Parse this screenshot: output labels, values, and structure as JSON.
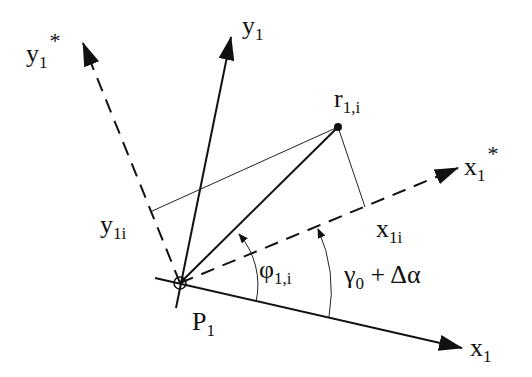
{
  "diagram": {
    "origin": {
      "label": "P",
      "sub": "1",
      "x": 180,
      "y": 283
    },
    "point": {
      "label": "r",
      "sub": "1,i",
      "x": 338,
      "y": 127
    },
    "axes": {
      "x1": {
        "label": "x",
        "sub": "1",
        "sup": "",
        "style": "solid"
      },
      "y1": {
        "label": "y",
        "sub": "1",
        "sup": "",
        "style": "solid"
      },
      "x1_star": {
        "label": "x",
        "sub": "1",
        "sup": "*",
        "style": "dashed"
      },
      "y1_star": {
        "label": "y",
        "sub": "1",
        "sup": "*",
        "style": "dashed"
      }
    },
    "projections": {
      "x1i": {
        "label": "x",
        "sub": "1i"
      },
      "y1i": {
        "label": "y",
        "sub": "1i"
      }
    },
    "angles": {
      "phi": {
        "label": "φ",
        "sub": "1,i"
      },
      "gamma": {
        "label": "γ",
        "sub": "0",
        "suffix": " + Δα"
      }
    },
    "colors": {
      "stroke": "#111111",
      "background": "#ffffff"
    }
  }
}
